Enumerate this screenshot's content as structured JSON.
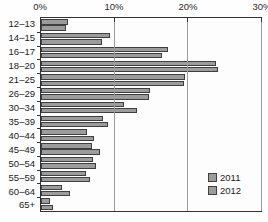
{
  "chart_data": {
    "type": "bar",
    "orientation": "horizontal",
    "title": "",
    "xlabel": "",
    "ylabel": "",
    "categories": [
      "12–13",
      "14–15",
      "16–17",
      "18–20",
      "21–25",
      "26–29",
      "30–34",
      "35–39",
      "40–44",
      "45–49",
      "50–54",
      "55–59",
      "60–64",
      "65+"
    ],
    "series": [
      {
        "name": "2011",
        "values": [
          3.6,
          9.3,
          17.3,
          23.8,
          19.6,
          14.8,
          11.2,
          8.4,
          6.3,
          6.9,
          7.1,
          6.1,
          2.9,
          1.2
        ]
      },
      {
        "name": "2012",
        "values": [
          3.4,
          8.3,
          16.4,
          24.0,
          19.4,
          14.6,
          13.0,
          9.1,
          7.2,
          8.0,
          7.4,
          6.6,
          3.9,
          1.6
        ]
      }
    ],
    "x_tick_labels": [
      "0%",
      "10%",
      "20%",
      "30%"
    ],
    "xlim": [
      0,
      30
    ],
    "grid": true,
    "legend_position": "bottom-right",
    "colors": {
      "bar_fill": "#9c9c9c",
      "bar_border": "#3f3f3f",
      "axis": "#333333",
      "gridline": "#9b9b9b",
      "background": "#fefefe"
    }
  }
}
